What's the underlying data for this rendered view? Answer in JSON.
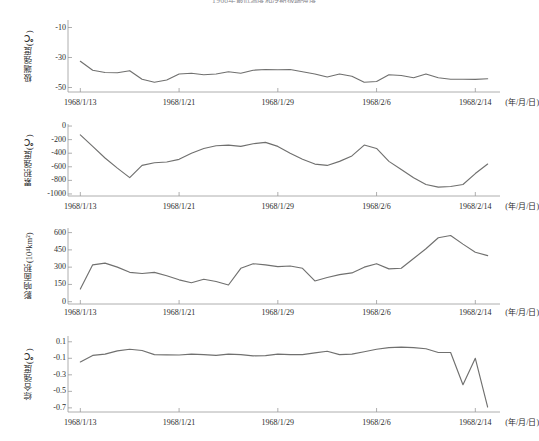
{
  "figure": {
    "title": "1968年最低温度和冷期极端强度",
    "x_unit_label": "(年/月/日)",
    "line_color": "#70706f",
    "axis_color": "#9a9a9a",
    "background": "#ffffff"
  },
  "shared_x": {
    "tick_labels": [
      "1968/1/13",
      "1968/1/21",
      "1968/1/29",
      "1968/2/6",
      "1968/2/14"
    ],
    "tick_values": [
      0,
      8,
      16,
      24,
      32
    ],
    "xlim": [
      -1,
      34
    ]
  },
  "chart_data": [
    {
      "type": "line",
      "panel": 1,
      "title": "",
      "xlabel": "(年/月/日)",
      "ylabel": "极端强度(℃)",
      "ytick_labels": [
        "-10",
        "-30",
        "-50"
      ],
      "ytick_values": [
        -10,
        -30,
        -50
      ],
      "ylim": [
        -53,
        -5
      ],
      "xlim": [
        -1,
        34
      ],
      "grid": false,
      "legend": "none",
      "x": [
        0,
        1,
        2,
        3,
        4,
        5,
        6,
        7,
        8,
        9,
        10,
        11,
        12,
        13,
        14,
        15,
        16,
        17,
        18,
        19,
        20,
        21,
        22,
        23,
        24,
        25,
        26,
        27,
        28,
        29,
        30,
        31,
        32,
        33
      ],
      "values": [
        -32.5,
        -38.5,
        -40.0,
        -40.2,
        -38.8,
        -44.5,
        -46.5,
        -45.0,
        -41.0,
        -40.5,
        -41.5,
        -41.0,
        -39.5,
        -40.5,
        -38.5,
        -38.0,
        -38.2,
        -38.0,
        -39.5,
        -41.0,
        -43.0,
        -41.0,
        -42.5,
        -46.5,
        -46.0,
        -41.5,
        -42.0,
        -43.5,
        -41.0,
        -43.5,
        -44.5,
        -44.5,
        -44.6,
        -44.2
      ]
    },
    {
      "type": "line",
      "panel": 2,
      "title": "",
      "xlabel": "(年/月/日)",
      "ylabel": "累积强度(℃)",
      "ytick_labels": [
        "0",
        "-200",
        "-400",
        "-600",
        "-800",
        "-1000"
      ],
      "ytick_values": [
        0,
        -200,
        -400,
        -600,
        -800,
        -1000
      ],
      "ylim": [
        -1030,
        30
      ],
      "xlim": [
        -1,
        34
      ],
      "grid": false,
      "legend": "none",
      "x": [
        0,
        1,
        2,
        3,
        4,
        5,
        6,
        7,
        8,
        9,
        10,
        11,
        12,
        13,
        14,
        15,
        16,
        17,
        18,
        19,
        20,
        21,
        22,
        23,
        24,
        25,
        26,
        27,
        28,
        29,
        30,
        31,
        32,
        33
      ],
      "values": [
        -130,
        -300,
        -470,
        -620,
        -760,
        -580,
        -540,
        -530,
        -490,
        -400,
        -330,
        -290,
        -280,
        -300,
        -260,
        -240,
        -300,
        -400,
        -490,
        -560,
        -580,
        -520,
        -440,
        -280,
        -330,
        -520,
        -640,
        -760,
        -860,
        -900,
        -890,
        -860,
        -700,
        -560
      ]
    },
    {
      "type": "line",
      "panel": 3,
      "title": "",
      "xlabel": "(年/月/日)",
      "ylabel": "影响面积(10⁴km²)",
      "ytick_labels": [
        "600",
        "450",
        "300",
        "150",
        "0"
      ],
      "ytick_values": [
        600,
        450,
        300,
        150,
        0
      ],
      "ylim": [
        -20,
        640
      ],
      "xlim": [
        -1,
        34
      ],
      "grid": false,
      "legend": "none",
      "x": [
        0,
        1,
        2,
        3,
        4,
        5,
        6,
        7,
        8,
        9,
        10,
        11,
        12,
        13,
        14,
        15,
        16,
        17,
        18,
        19,
        20,
        21,
        22,
        23,
        24,
        25,
        26,
        27,
        28,
        29,
        30,
        31,
        32,
        33
      ],
      "values": [
        110,
        320,
        335,
        300,
        255,
        245,
        255,
        225,
        190,
        165,
        195,
        175,
        145,
        290,
        330,
        320,
        305,
        310,
        290,
        180,
        210,
        235,
        250,
        300,
        330,
        285,
        290,
        375,
        460,
        555,
        575,
        500,
        430,
        400
      ]
    },
    {
      "type": "line",
      "panel": 4,
      "title": "",
      "xlabel": "(年/月/日)",
      "ylabel": "综合强度(℃)",
      "ytick_labels": [
        "0.1",
        "-0.1",
        "-0.3",
        "-0.5",
        "-0.7"
      ],
      "ytick_values": [
        0.1,
        -0.1,
        -0.3,
        -0.5,
        -0.7
      ],
      "ylim": [
        -0.75,
        0.17
      ],
      "xlim": [
        -1,
        34
      ],
      "grid": false,
      "legend": "none",
      "x": [
        0,
        1,
        2,
        3,
        4,
        5,
        6,
        7,
        8,
        9,
        10,
        11,
        12,
        13,
        14,
        15,
        16,
        17,
        18,
        19,
        20,
        21,
        22,
        23,
        24,
        25,
        26,
        27,
        28,
        29,
        30,
        31,
        32,
        33
      ],
      "values": [
        -0.145,
        -0.065,
        -0.05,
        -0.01,
        0.01,
        -0.005,
        -0.055,
        -0.058,
        -0.06,
        -0.05,
        -0.055,
        -0.065,
        -0.05,
        -0.055,
        -0.07,
        -0.068,
        -0.05,
        -0.055,
        -0.055,
        -0.035,
        -0.015,
        -0.055,
        -0.05,
        -0.02,
        0.01,
        0.03,
        0.035,
        0.03,
        0.015,
        -0.03,
        -0.03,
        -0.42,
        -0.1,
        -0.69
      ]
    }
  ]
}
